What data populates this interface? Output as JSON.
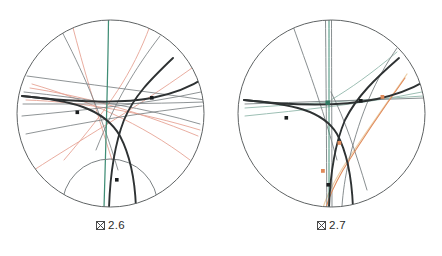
{
  "page": {
    "background_color": "#ffffff",
    "width": 442,
    "height": 256,
    "kind": "two-panel-geometry-figure"
  },
  "figures": [
    {
      "id": "figure-2-6",
      "caption_glyph": "tofu-box",
      "caption_text": "2.6",
      "disk": {
        "cx": 110.5,
        "cy": 113.5,
        "r": 93.5,
        "stroke": "#5f6364",
        "stroke_width": 1.0
      },
      "colors": {
        "boundary": "#5f6364",
        "thick_geodesic": "#2e3233",
        "thin_gray": "#7b8183",
        "pale_gray": "#9aa0a2",
        "salmon": "#e6a495",
        "salmon_dark": "#d98b78",
        "teal": "#3f8d75",
        "point": "#1a1d1e"
      },
      "elements": {
        "thick_geodesics": 3,
        "thin_gray_geodesics": 7,
        "salmon_geodesics": 6,
        "teal_geodesics": 1,
        "marked_points": 3,
        "small_arc_bottom": 1
      }
    },
    {
      "id": "figure-2-7",
      "caption_glyph": "tofu-box",
      "caption_text": "2.7",
      "disk": {
        "cx": 110.5,
        "cy": 113.5,
        "r": 93.5,
        "stroke": "#5f6364",
        "stroke_width": 1.0
      },
      "colors": {
        "boundary": "#5f6364",
        "thick_geodesic": "#2e3233",
        "thin_gray": "#7b8183",
        "pale_gray": "#9aa0a2",
        "orange": "#e08a5a",
        "orange_pale": "#eccfa8",
        "teal": "#3f8d75",
        "teal_pale": "#9dbfb4",
        "point": "#1a1d1e"
      },
      "elements": {
        "thick_geodesics": 3,
        "thin_gray_geodesics": 6,
        "teal_geodesics": 3,
        "orange_geodesics": 1,
        "marked_points_dark": 3,
        "marked_points_orange": 3,
        "marked_points_teal": 1
      }
    }
  ]
}
